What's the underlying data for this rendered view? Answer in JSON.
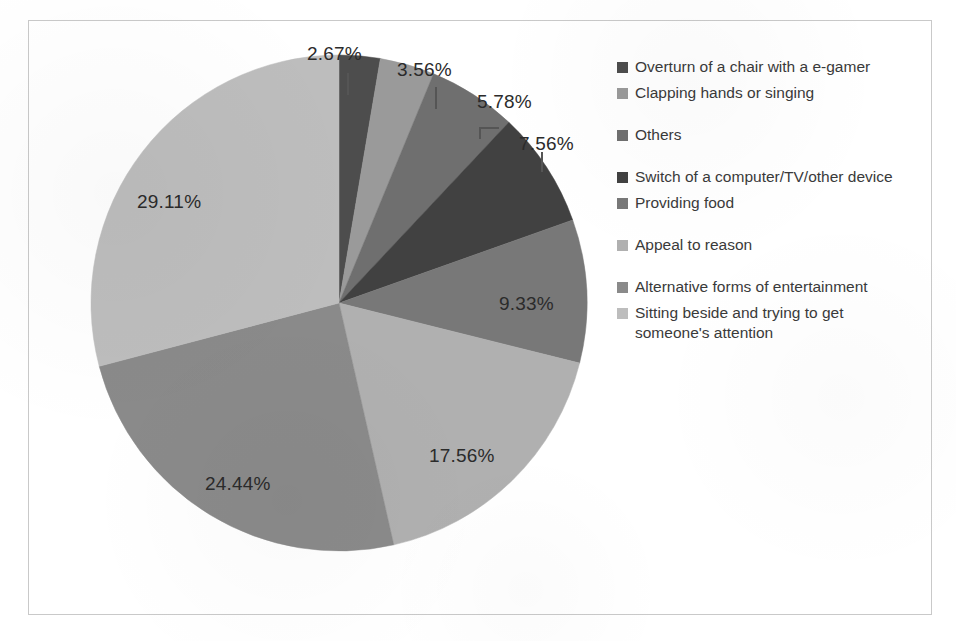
{
  "chart_data": {
    "type": "pie",
    "title": "",
    "subtitle": "",
    "xlabel": "",
    "ylabel": "",
    "legend_position": "right",
    "grid": false,
    "value_unit": "%",
    "start_angle_deg": 0,
    "direction": "clockwise",
    "categories": [
      "Overturn of a chair with a e-gamer",
      "Clapping hands or singing",
      "Others",
      "Switch of a computer/TV/other device",
      "Providing food",
      "Appeal to reason",
      "Alternative forms of entertainment",
      "Sitting beside and trying to get someone's attention"
    ],
    "values": [
      2.67,
      3.56,
      5.78,
      7.56,
      9.33,
      17.56,
      24.44,
      29.11
    ],
    "data_labels": [
      "2.67%",
      "3.56%",
      "5.78%",
      "7.56%",
      "9.33%",
      "17.56%",
      "24.44%",
      "29.11%"
    ],
    "colors": [
      "#4d4d4d",
      "#9a9a9a",
      "#6f6f6f",
      "#414141",
      "#787878",
      "#b0b0b0",
      "#8a8a8a",
      "#bdbdbd"
    ],
    "slices": [
      {
        "label": "Overturn of a chair with a e-gamer",
        "value": 2.67,
        "display": "2.67%",
        "color": "#4d4d4d"
      },
      {
        "label": "Clapping hands or singing",
        "value": 3.56,
        "display": "3.56%",
        "color": "#9a9a9a"
      },
      {
        "label": "Others",
        "value": 5.78,
        "display": "5.78%",
        "color": "#6f6f6f"
      },
      {
        "label": "Switch of a computer/TV/other device",
        "value": 7.56,
        "display": "7.56%",
        "color": "#414141"
      },
      {
        "label": "Providing food",
        "value": 9.33,
        "display": "9.33%",
        "color": "#787878"
      },
      {
        "label": "Appeal to reason",
        "value": 17.56,
        "display": "17.56%",
        "color": "#b0b0b0"
      },
      {
        "label": "Alternative forms of entertainment",
        "value": 24.44,
        "display": "24.44%",
        "color": "#8a8a8a"
      },
      {
        "label": "Sitting beside and trying to get someone's attention",
        "value": 29.11,
        "display": "29.11%",
        "color": "#bdbdbd"
      }
    ]
  },
  "legend": {
    "items": [
      {
        "label": "Overturn of a chair with a e-gamer",
        "color": "#4d4d4d"
      },
      {
        "label": "Clapping hands or singing",
        "color": "#9a9a9a"
      },
      {
        "label": "Others",
        "color": "#6f6f6f"
      },
      {
        "label": "Switch of a computer/TV/other device",
        "color": "#414141"
      },
      {
        "label": "Providing food",
        "color": "#787878"
      },
      {
        "label": "Appeal to reason",
        "color": "#b0b0b0"
      },
      {
        "label": "Alternative forms of entertainment",
        "color": "#8a8a8a"
      },
      {
        "label": "Sitting beside and trying to get someone's attention",
        "color": "#bdbdbd"
      }
    ]
  },
  "labels": {
    "l0": "2.67%",
    "l1": "3.56%",
    "l2": "5.78%",
    "l3": "7.56%",
    "l4": "9.33%",
    "l5": "17.56%",
    "l6": "24.44%",
    "l7": "29.11%"
  },
  "style": {
    "frame_color": "#c9c9c9",
    "background": "#ffffff",
    "text_color": "#2b2b2b"
  }
}
